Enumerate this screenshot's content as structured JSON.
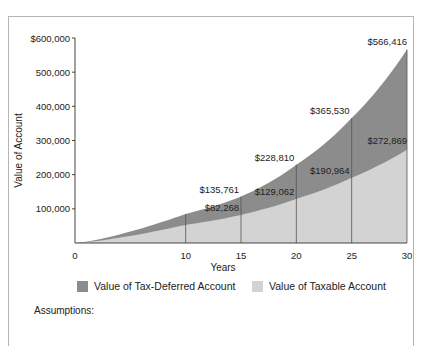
{
  "chart_data": {
    "type": "area",
    "title": "",
    "xlabel": "Years",
    "ylabel": "Value of Account",
    "xlim": [
      0,
      30
    ],
    "ylim": [
      0,
      600000
    ],
    "x_ticks": [
      "0",
      "10",
      "15",
      "20",
      "25",
      "30"
    ],
    "y_ticks": [
      "$600,000",
      "500,000",
      "400,000",
      "300,000",
      "200,000",
      "100,000"
    ],
    "grid": "vertical lines at years 10, 15, 20, 25",
    "legend_position": "bottom",
    "x": [
      0,
      10,
      15,
      20,
      25,
      30
    ],
    "series": [
      {
        "name": "Value of Tax-Deferred Account",
        "color": "#8c8c8c",
        "values": [
          0,
          85000,
          135761,
          228810,
          365530,
          566416
        ],
        "labels": [
          "",
          "",
          "$135,761",
          "$228,810",
          "$365,530",
          "$566,416"
        ]
      },
      {
        "name": "Value of Taxable Account",
        "color": "#d3d3d3",
        "values": [
          0,
          53000,
          82268,
          129062,
          190964,
          272869
        ],
        "labels": [
          "",
          "",
          "$82,268",
          "$129,062",
          "$190,964",
          "$272,869"
        ]
      }
    ]
  },
  "legend": {
    "tax_deferred": "Value of Tax-Deferred Account",
    "taxable": "Value of Taxable Account"
  },
  "axes": {
    "x_title": "Years",
    "y_title": "Value of Account"
  },
  "footer": {
    "assumptions_label": "Assumptions:"
  }
}
